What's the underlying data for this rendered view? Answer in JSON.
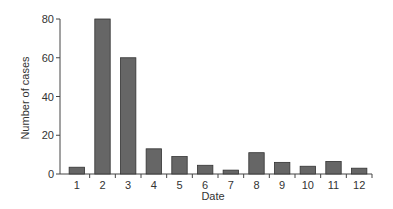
{
  "chart_data": {
    "type": "bar",
    "title": "",
    "xlabel": "Date",
    "ylabel": "Number of cases",
    "categories": [
      "1",
      "2",
      "3",
      "4",
      "5",
      "6",
      "7",
      "8",
      "9",
      "10",
      "11",
      "12"
    ],
    "values": [
      3.5,
      80,
      60,
      13,
      9,
      4.5,
      2,
      11,
      6,
      4,
      6.5,
      3
    ],
    "ylim": [
      0,
      80
    ],
    "yticks": [
      0,
      20,
      40,
      60,
      80
    ],
    "grid": false,
    "legend": null,
    "bar_color": "#666666",
    "bar_edge_color": "#333333"
  }
}
